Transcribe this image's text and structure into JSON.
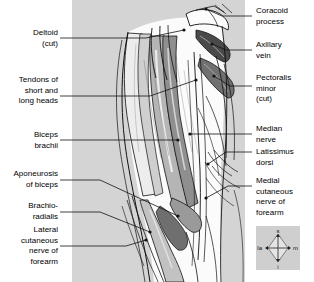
{
  "figure": {
    "panel_color": "#d4d4d4",
    "line_color": "#000000",
    "muscle_light": "#f2f2f2",
    "muscle_mid": "#b9b9b9",
    "muscle_dark": "#8a8a8a",
    "muscle_darkest": "#5a5a5a"
  },
  "labels_left": [
    {
      "id": "deltoid",
      "text": "Deltoid\n(cut)"
    },
    {
      "id": "tendons-short-long-heads",
      "text": "Tendons of\nshort and\nlong heads"
    },
    {
      "id": "biceps-brachii",
      "text": "Biceps\nbrachii"
    },
    {
      "id": "aponeurosis-of-biceps",
      "text": "Aponeurosis\nof biceps"
    },
    {
      "id": "brachioradialis",
      "text": "Brachio-\nradialis"
    },
    {
      "id": "lateral-cutaneous-nerve-of-forearm",
      "text": "Lateral\ncutaneous\nnerve of\nforearm"
    }
  ],
  "labels_right": [
    {
      "id": "coracoid-process",
      "text": "Coracoid\nprocess"
    },
    {
      "id": "axillary-vein",
      "text": "Axillary\nvein"
    },
    {
      "id": "pectoralis-minor",
      "text": "Pectoralis\nminor\n(cut)"
    },
    {
      "id": "median-nerve",
      "text": "Median\nnerve"
    },
    {
      "id": "latissimus-dorsi",
      "text": "Latissimus\ndorsi"
    },
    {
      "id": "medial-cutaneous-nerve-of-forearm",
      "text": "Medial\ncutaneous\nnerve of\nforearm"
    }
  ],
  "compass": {
    "superior": "s",
    "inferior": "i",
    "lateral": "la",
    "medial": "m"
  }
}
